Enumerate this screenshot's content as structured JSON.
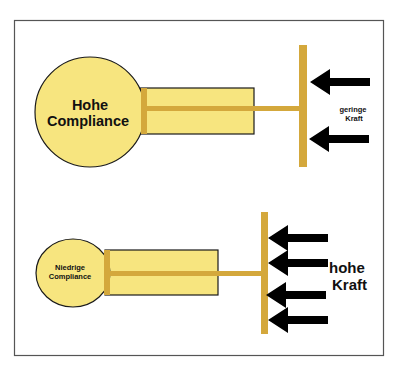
{
  "colors": {
    "background": "#ffffff",
    "frame": "#555555",
    "bulb_fill": "#f7e57f",
    "bulb_stroke": "#1a1a1a",
    "rod": "#d4a83c",
    "arrow": "#000000",
    "text": "#111111"
  },
  "top_model": {
    "label_line1": "Hohe",
    "label_line2": "Compliance",
    "force_line1": "geringe",
    "force_line2": "Kraft",
    "arrow_count": 2
  },
  "bottom_model": {
    "label_line1": "Niedrige",
    "label_line2": "Compliance",
    "force_line1": "hohe",
    "force_line2": "Kraft",
    "arrow_count": 4
  }
}
